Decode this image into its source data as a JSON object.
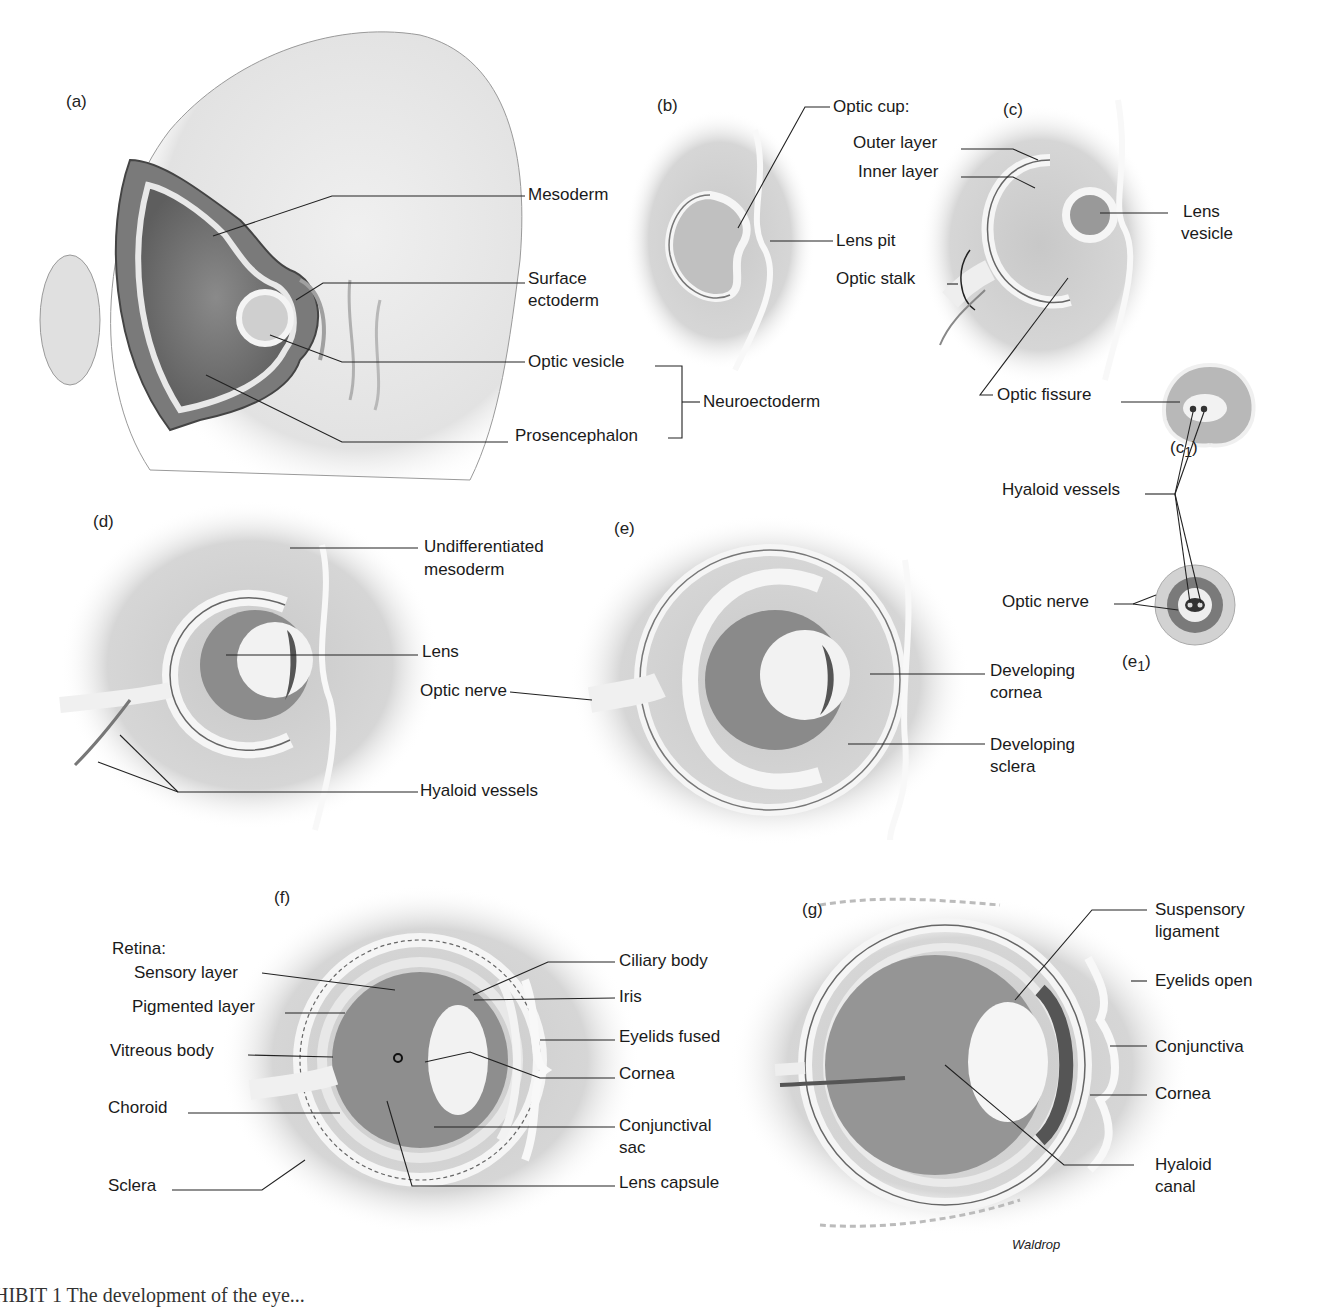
{
  "figure": {
    "credit": "Waldrop",
    "caption_partial": "HIBIT 1  The development of the eye...",
    "panels": {
      "a": {
        "id": "(a)",
        "labels": {
          "mesoderm": "Mesoderm",
          "surface_ectoderm_1": "Surface",
          "surface_ectoderm_2": "ectoderm",
          "optic_vesicle": "Optic vesicle",
          "prosencephalon": "Prosencephalon",
          "neuroectoderm": "Neuroectoderm"
        }
      },
      "b": {
        "id": "(b)",
        "labels": {
          "optic_cup": "Optic cup:",
          "lens_pit": "Lens pit"
        }
      },
      "c": {
        "id": "(c)",
        "labels": {
          "outer_layer": "Outer layer",
          "inner_layer": "Inner layer",
          "lens_vesicle_1": "Lens",
          "lens_vesicle_2": "vesicle",
          "optic_stalk": "Optic stalk",
          "optic_fissure": "Optic fissure"
        }
      },
      "c1": {
        "id_main": "(c",
        "id_sub": "1",
        "id_close": ")",
        "labels": {
          "hyaloid_vessels": "Hyaloid vessels"
        }
      },
      "d": {
        "id": "(d)",
        "labels": {
          "undiff_1": "Undifferentiated",
          "undiff_2": "mesoderm",
          "lens": "Lens",
          "optic_nerve": "Optic nerve",
          "hyaloid_vessels": "Hyaloid vessels"
        }
      },
      "e": {
        "id": "(e)",
        "labels": {
          "dev_cornea_1": "Developing",
          "dev_cornea_2": "cornea",
          "dev_sclera_1": "Developing",
          "dev_sclera_2": "sclera"
        }
      },
      "e1": {
        "id_main": "(e",
        "id_sub": "1",
        "id_close": ")",
        "labels": {
          "optic_nerve": "Optic nerve"
        }
      },
      "f": {
        "id": "(f)",
        "labels": {
          "retina": "Retina:",
          "sensory_layer": "Sensory layer",
          "pigmented_layer": "Pigmented layer",
          "vitreous_body": "Vitreous body",
          "choroid": "Choroid",
          "sclera": "Sclera",
          "ciliary_body": "Ciliary body",
          "iris": "Iris",
          "eyelids_fused": "Eyelids fused",
          "cornea": "Cornea",
          "conj_sac_1": "Conjunctival",
          "conj_sac_2": "sac",
          "lens_capsule": "Lens capsule"
        }
      },
      "g": {
        "id": "(g)",
        "labels": {
          "suspensory_1": "Suspensory",
          "suspensory_2": "ligament",
          "eyelids_open": "Eyelids open",
          "conjunctiva": "Conjunctiva",
          "cornea": "Cornea",
          "hyaloid_1": "Hyaloid",
          "hyaloid_2": "canal"
        }
      }
    }
  }
}
